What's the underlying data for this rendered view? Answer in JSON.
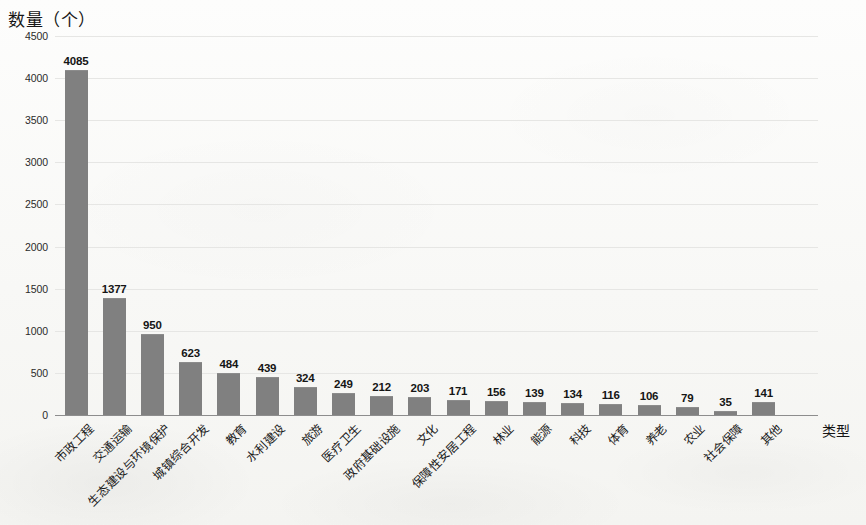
{
  "chart_data": {
    "type": "bar",
    "title": "",
    "ylabel": "数量（个）",
    "xlabel": "类型",
    "ylim": [
      0,
      4500
    ],
    "yticks": [
      0,
      500,
      1000,
      1500,
      2000,
      2500,
      3000,
      3500,
      4000,
      4500
    ],
    "ytick_labels": [
      "0",
      "500",
      "1000",
      "1500",
      "2000",
      "2500",
      "3000",
      "3500",
      "4000",
      "4500"
    ],
    "grid": true,
    "legend": false,
    "bar_color": "#808080",
    "gridline_color": "#e6e6e4",
    "axis_color": "#8d8d8d",
    "categories": [
      "市政工程",
      "交通运输",
      "生态建设与环境保护",
      "城镇综合开发",
      "教育",
      "水利建设",
      "旅游",
      "医疗卫生",
      "政府基础设施",
      "文化",
      "保障性安居工程",
      "林业",
      "能源",
      "科技",
      "体育",
      "养老",
      "农业",
      "社会保障",
      "其他"
    ],
    "values": [
      4085,
      1377,
      950,
      623,
      484,
      439,
      324,
      249,
      212,
      203,
      171,
      156,
      139,
      134,
      116,
      106,
      79,
      35,
      141
    ],
    "value_labels": [
      "4085",
      "1377",
      "950",
      "623",
      "484",
      "439",
      "324",
      "249",
      "212",
      "203",
      "171",
      "156",
      "139",
      "134",
      "116",
      "106",
      "79",
      "35",
      "141"
    ]
  }
}
